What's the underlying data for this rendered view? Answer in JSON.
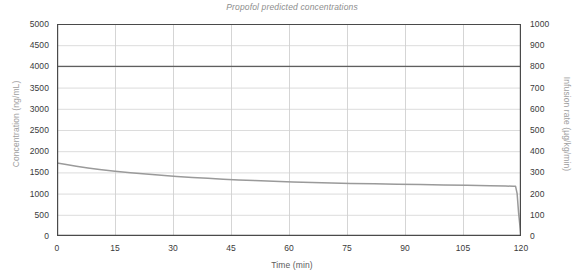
{
  "chart_data": {
    "type": "line",
    "title": "Propofol predicted concentrations",
    "xlabel": "Time (min)",
    "ylabel": "Concentration (ng/mL)",
    "ylabel_right": "Infusion rate (µg/kg/min)",
    "xlim": [
      0,
      120
    ],
    "ylim": [
      0,
      5000
    ],
    "ylim_right": [
      0,
      1000
    ],
    "grid": true,
    "legend": "none",
    "xticks": [
      0,
      15,
      30,
      45,
      60,
      75,
      90,
      105,
      120
    ],
    "xtick_labels": [
      "0",
      "15",
      "30",
      "45",
      "60",
      "75",
      "90",
      "105",
      "120"
    ],
    "yticks": [
      0,
      500,
      1000,
      1500,
      2000,
      2500,
      3000,
      3500,
      4000,
      4500,
      5000
    ],
    "ytick_labels": [
      "0",
      "500",
      "1000",
      "1500",
      "2000",
      "2500",
      "3000",
      "3500",
      "4000",
      "4500",
      "5000"
    ],
    "yticks_right": [
      0,
      100,
      200,
      300,
      400,
      500,
      600,
      700,
      800,
      900,
      1000
    ],
    "ytick_labels_right": [
      "0",
      "100",
      "200",
      "300",
      "400",
      "500",
      "600",
      "700",
      "800",
      "900",
      "1000"
    ],
    "series": [
      {
        "name": "Infusion rate",
        "axis": "right",
        "color": "#5f5f5f",
        "width": 1.3,
        "x": [
          0,
          120
        ],
        "values": [
          800,
          800
        ]
      },
      {
        "name": "Predicted concentration",
        "axis": "left",
        "color": "#9a9a9a",
        "width": 1.5,
        "x": [
          0,
          2,
          5,
          8,
          11,
          15,
          19,
          23,
          27,
          31,
          35,
          39,
          43,
          47,
          51,
          56,
          61,
          66,
          71,
          76,
          82,
          88,
          94,
          100,
          106,
          112,
          116,
          118,
          118.6,
          119,
          119.4,
          120
        ],
        "values": [
          1720,
          1690,
          1645,
          1605,
          1570,
          1528,
          1492,
          1460,
          1432,
          1406,
          1382,
          1360,
          1341,
          1323,
          1307,
          1290,
          1275,
          1262,
          1251,
          1241,
          1230,
          1221,
          1212,
          1203,
          1194,
          1185,
          1178,
          1174,
          1172,
          1000,
          520,
          0
        ]
      }
    ],
    "annotations": []
  }
}
